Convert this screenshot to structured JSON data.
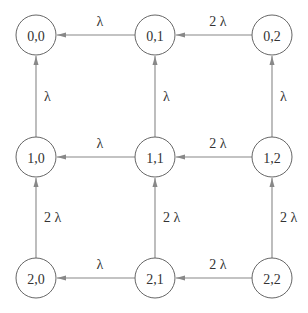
{
  "diagram": {
    "type": "state-transition-graph",
    "nodes": [
      {
        "id": "0,0",
        "label": "0,0",
        "row": 0,
        "col": 0
      },
      {
        "id": "0,1",
        "label": "0,1",
        "row": 0,
        "col": 1
      },
      {
        "id": "0,2",
        "label": "0,2",
        "row": 0,
        "col": 2
      },
      {
        "id": "1,0",
        "label": "1,0",
        "row": 1,
        "col": 0
      },
      {
        "id": "1,1",
        "label": "1,1",
        "row": 1,
        "col": 1
      },
      {
        "id": "1,2",
        "label": "1,2",
        "row": 1,
        "col": 2
      },
      {
        "id": "2,0",
        "label": "2,0",
        "row": 2,
        "col": 0
      },
      {
        "id": "2,1",
        "label": "2,1",
        "row": 2,
        "col": 1
      },
      {
        "id": "2,2",
        "label": "2,2",
        "row": 2,
        "col": 2
      }
    ],
    "edges": [
      {
        "from": "0,1",
        "to": "0,0",
        "label": "λ"
      },
      {
        "from": "0,2",
        "to": "0,1",
        "label": "2 λ"
      },
      {
        "from": "1,1",
        "to": "1,0",
        "label": "λ"
      },
      {
        "from": "1,2",
        "to": "1,1",
        "label": "2 λ"
      },
      {
        "from": "2,1",
        "to": "2,0",
        "label": "λ"
      },
      {
        "from": "2,2",
        "to": "2,1",
        "label": "2 λ"
      },
      {
        "from": "1,0",
        "to": "0,0",
        "label": "λ"
      },
      {
        "from": "1,1",
        "to": "0,1",
        "label": "λ"
      },
      {
        "from": "1,2",
        "to": "0,2",
        "label": "λ"
      },
      {
        "from": "2,0",
        "to": "1,0",
        "label": "2 λ"
      },
      {
        "from": "2,1",
        "to": "1,1",
        "label": "2 λ"
      },
      {
        "from": "2,2",
        "to": "1,2",
        "label": "2 λ"
      }
    ]
  }
}
